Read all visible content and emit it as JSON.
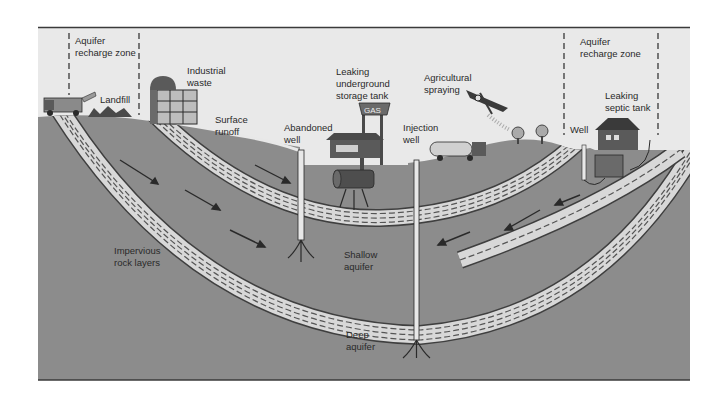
{
  "diagram": {
    "type": "cross-section illustration",
    "colors": {
      "sky": "#e9e9e9",
      "ground": "#8c8c8c",
      "aquifer_band": "#d8d8d8",
      "dash": "#555555",
      "ink": "#2a2a2a",
      "frame": "#3a3a3a"
    },
    "labels": {
      "recharge_left": [
        "Aquifer",
        "recharge zone"
      ],
      "landfill": "Landfill",
      "industrial": [
        "Industrial",
        "waste"
      ],
      "surface_runoff": [
        "Surface",
        "runoff"
      ],
      "abandoned_well": [
        "Abandoned",
        "well"
      ],
      "leaking_tank": [
        "Leaking",
        "underground",
        "storage tank"
      ],
      "gas_sign": "GAS",
      "injection_well": [
        "Injection",
        "well"
      ],
      "agricultural": [
        "Agricultural",
        "spraying"
      ],
      "recharge_right": [
        "Aquifer",
        "recharge zone"
      ],
      "septic": [
        "Leaking",
        "septic tank"
      ],
      "well": "Well",
      "impervious": [
        "Impervious",
        "rock layers"
      ],
      "shallow_aquifer": [
        "Shallow",
        "aquifer"
      ],
      "deep_aquifer": [
        "Deep",
        "aquifer"
      ]
    }
  }
}
